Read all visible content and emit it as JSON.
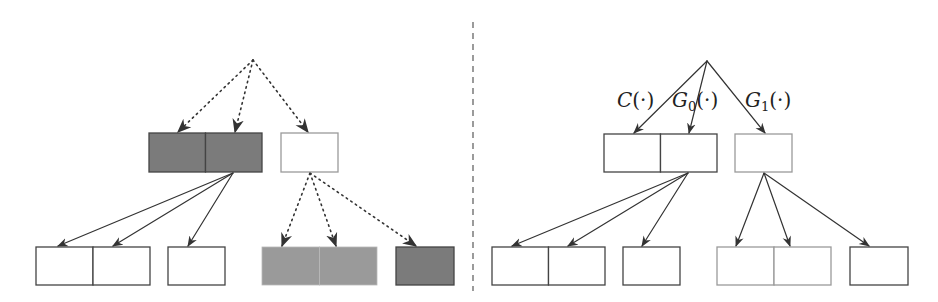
{
  "colors": {
    "dark_fill": "#7b7b7b",
    "light_gray_fill": "#9a9a9a",
    "white_fill": "#ffffff",
    "stroke_dark": "#444444",
    "stroke_gray": "#9a9a9a",
    "edge": "#333333",
    "divider": "#666666"
  },
  "left_tree": {
    "root": {
      "x": 224,
      "y": 21,
      "w": 58,
      "h": 38,
      "fill": "white",
      "stroke": "gray"
    },
    "level1": [
      {
        "id": "l1-pair",
        "x": 149,
        "y": 133,
        "w": 113,
        "h": 39,
        "cells": 2,
        "fill": "dark",
        "stroke": "dark"
      },
      {
        "id": "l1-single",
        "x": 281,
        "y": 133,
        "w": 57,
        "h": 39,
        "cells": 1,
        "fill": "white",
        "stroke": "gray"
      }
    ],
    "level2": [
      {
        "id": "l2-pair-a",
        "x": 36,
        "y": 247,
        "w": 114,
        "h": 38,
        "cells": 2,
        "fill": "white",
        "stroke": "dark"
      },
      {
        "id": "l2-single-a",
        "x": 168,
        "y": 247,
        "w": 57,
        "h": 38,
        "cells": 1,
        "fill": "white",
        "stroke": "dark"
      },
      {
        "id": "l2-pair-b",
        "x": 262,
        "y": 247,
        "w": 115,
        "h": 38,
        "cells": 2,
        "fill": "lightgray",
        "stroke": "none"
      },
      {
        "id": "l2-single-b",
        "x": 396,
        "y": 247,
        "w": 58,
        "h": 38,
        "cells": 1,
        "fill": "dark",
        "stroke": "dark"
      }
    ],
    "edges": [
      {
        "from": [
          253,
          60
        ],
        "to": [
          178,
          132
        ],
        "style": "dotted"
      },
      {
        "from": [
          253,
          60
        ],
        "to": [
          235,
          132
        ],
        "style": "dotted"
      },
      {
        "from": [
          253,
          60
        ],
        "to": [
          308,
          132
        ],
        "style": "dotted"
      },
      {
        "from": [
          233,
          173
        ],
        "to": [
          58,
          246
        ],
        "style": "solid"
      },
      {
        "from": [
          233,
          173
        ],
        "to": [
          113,
          246
        ],
        "style": "solid"
      },
      {
        "from": [
          233,
          173
        ],
        "to": [
          188,
          246
        ],
        "style": "solid"
      },
      {
        "from": [
          310,
          173
        ],
        "to": [
          282,
          246
        ],
        "style": "dotted"
      },
      {
        "from": [
          310,
          173
        ],
        "to": [
          336,
          246
        ],
        "style": "dotted"
      },
      {
        "from": [
          310,
          173
        ],
        "to": [
          416,
          246
        ],
        "style": "dotted"
      }
    ]
  },
  "right_tree": {
    "root": {
      "x": 678,
      "y": 22,
      "w": 59,
      "h": 38,
      "fill": "dark",
      "stroke": "gray"
    },
    "level1": [
      {
        "id": "r1-pair",
        "x": 604,
        "y": 134,
        "w": 113,
        "h": 38,
        "cells": 2,
        "fill": "white",
        "stroke": "dark"
      },
      {
        "id": "r1-single",
        "x": 735,
        "y": 134,
        "w": 57,
        "h": 38,
        "cells": 1,
        "fill": "white",
        "stroke": "gray"
      }
    ],
    "level2": [
      {
        "id": "r2-pair-a",
        "x": 492,
        "y": 247,
        "w": 113,
        "h": 38,
        "cells": 2,
        "fill": "white",
        "stroke": "dark"
      },
      {
        "id": "r2-single-a",
        "x": 623,
        "y": 247,
        "w": 57,
        "h": 38,
        "cells": 1,
        "fill": "white",
        "stroke": "dark"
      },
      {
        "id": "r2-pair-b",
        "x": 717,
        "y": 247,
        "w": 114,
        "h": 38,
        "cells": 2,
        "fill": "white",
        "stroke": "gray"
      },
      {
        "id": "r2-single-b",
        "x": 850,
        "y": 247,
        "w": 58,
        "h": 38,
        "cells": 1,
        "fill": "white",
        "stroke": "dark"
      }
    ],
    "edges": [
      {
        "from": [
          707,
          61
        ],
        "to": [
          634,
          133
        ],
        "style": "solid"
      },
      {
        "from": [
          707,
          61
        ],
        "to": [
          689,
          133
        ],
        "style": "solid"
      },
      {
        "from": [
          707,
          61
        ],
        "to": [
          765,
          133
        ],
        "style": "solid"
      },
      {
        "from": [
          688,
          173
        ],
        "to": [
          512,
          246
        ],
        "style": "solid"
      },
      {
        "from": [
          688,
          173
        ],
        "to": [
          568,
          246
        ],
        "style": "solid"
      },
      {
        "from": [
          688,
          173
        ],
        "to": [
          642,
          246
        ],
        "style": "solid"
      },
      {
        "from": [
          764,
          173
        ],
        "to": [
          736,
          246
        ],
        "style": "solid"
      },
      {
        "from": [
          764,
          173
        ],
        "to": [
          790,
          246
        ],
        "style": "solid"
      },
      {
        "from": [
          764,
          173
        ],
        "to": [
          869,
          246
        ],
        "style": "solid"
      }
    ],
    "labels": [
      {
        "id": "label-c",
        "main": "C",
        "sub": "",
        "arg": "(·)",
        "x": 617,
        "y": 107
      },
      {
        "id": "label-g0",
        "main": "G",
        "sub": "0",
        "arg": "(·)",
        "x": 672,
        "y": 107
      },
      {
        "id": "label-g1",
        "main": "G",
        "sub": "1",
        "arg": "(·)",
        "x": 745,
        "y": 107
      }
    ]
  },
  "divider": {
    "x": 473,
    "y1": 22,
    "y2": 291,
    "style": "dashed"
  }
}
